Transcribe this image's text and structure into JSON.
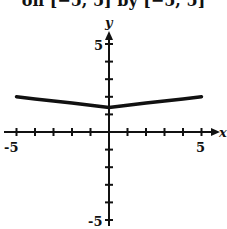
{
  "caption": "on [−5, 5] by [−5, 5]",
  "chart_data": {
    "type": "line",
    "title": "on [−5, 5] by [−5, 5]",
    "xlabel": "x",
    "ylabel": "y",
    "xlim": [
      -5,
      5
    ],
    "ylim": [
      -5,
      5
    ],
    "x_tick_labels": [
      "-5",
      "5"
    ],
    "y_tick_labels": [
      "5",
      "-5"
    ],
    "grid": false,
    "series": [
      {
        "name": "f(x)",
        "x": [
          -5,
          -4,
          -3,
          -2,
          -1,
          0,
          1,
          2,
          3,
          4,
          5
        ],
        "values": [
          2.0,
          1.88,
          1.76,
          1.64,
          1.52,
          1.4,
          1.52,
          1.64,
          1.76,
          1.88,
          2.0
        ]
      }
    ]
  }
}
